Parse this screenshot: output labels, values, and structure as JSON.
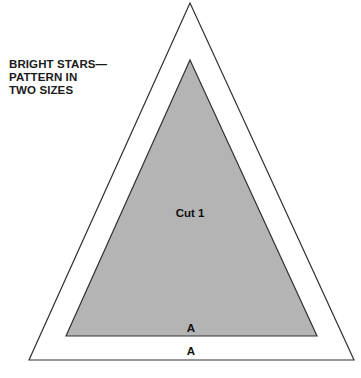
{
  "title": {
    "lines": [
      "BRIGHT STARS—",
      "PATTERN IN",
      "TWO SIZES"
    ]
  },
  "pieces": {
    "outer": {
      "label_base": "A",
      "stroke": "#333333",
      "fill": "#ffffff"
    },
    "inner": {
      "label_center": "Cut 1",
      "label_base": "A",
      "stroke": "#333333",
      "fill": "#b4b4b4"
    }
  }
}
